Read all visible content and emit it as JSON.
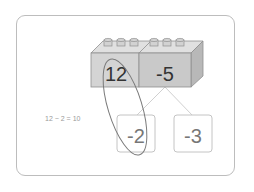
{
  "diagram": {
    "blocks": [
      {
        "label": "12",
        "face_color": "#d4d4d4"
      },
      {
        "label": "-5",
        "face_color": "#c9c9c9"
      }
    ],
    "split_boxes": [
      {
        "label": "-2"
      },
      {
        "label": "-3"
      }
    ],
    "equation": "12 − 2 = 10",
    "colors": {
      "frame_border": "#bdbdbd",
      "block_top": "#e2e2e2",
      "block_side": "#b5b5b5",
      "block_edge": "#8a8a8a",
      "ellipse": "#777777",
      "box_border": "#bbbbbb",
      "connector": "#cfcfcf"
    }
  }
}
